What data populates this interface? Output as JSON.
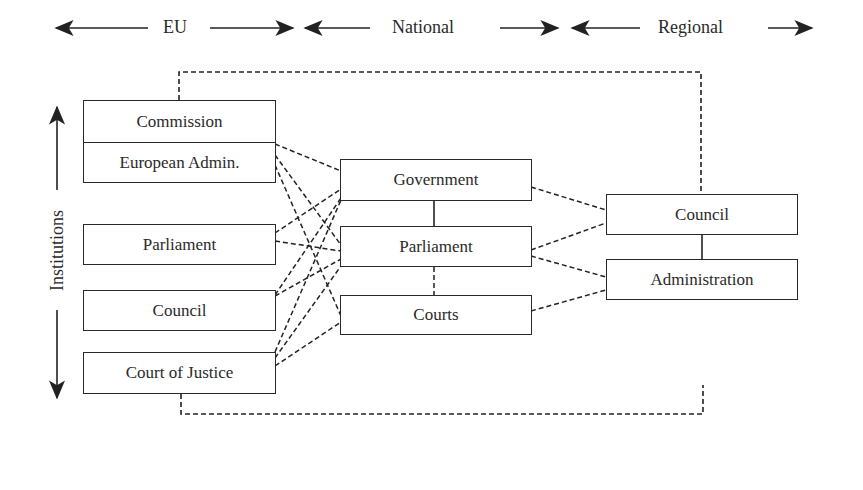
{
  "header": {
    "levels": [
      {
        "label": "EU"
      },
      {
        "label": "National"
      },
      {
        "label": "Regional"
      }
    ]
  },
  "axis": {
    "label": "Institutions"
  },
  "eu_boxes": [
    {
      "id": "commission",
      "label": "Commission"
    },
    {
      "id": "european_admin",
      "label": "European Admin."
    },
    {
      "id": "eu_parliament",
      "label": "Parliament"
    },
    {
      "id": "eu_council",
      "label": "Council"
    },
    {
      "id": "court_of_justice",
      "label": "Court of Justice"
    }
  ],
  "national_boxes": [
    {
      "id": "government",
      "label": "Government"
    },
    {
      "id": "nat_parliament",
      "label": "Parliament"
    },
    {
      "id": "courts",
      "label": "Courts"
    }
  ],
  "regional_boxes": [
    {
      "id": "reg_council",
      "label": "Council"
    },
    {
      "id": "administration",
      "label": "Administration"
    }
  ],
  "connections": {
    "solid": [
      [
        "government",
        "nat_parliament"
      ],
      [
        "reg_council",
        "administration"
      ]
    ],
    "dashed": [
      [
        "nat_parliament",
        "courts"
      ],
      [
        "european_admin",
        "government"
      ],
      [
        "european_admin",
        "nat_parliament"
      ],
      [
        "european_admin",
        "courts"
      ],
      [
        "eu_parliament",
        "government"
      ],
      [
        "eu_parliament",
        "nat_parliament"
      ],
      [
        "eu_council",
        "government"
      ],
      [
        "eu_council",
        "nat_parliament"
      ],
      [
        "court_of_justice",
        "government"
      ],
      [
        "court_of_justice",
        "nat_parliament"
      ],
      [
        "court_of_justice",
        "courts"
      ],
      [
        "government",
        "reg_council"
      ],
      [
        "nat_parliament",
        "reg_council"
      ],
      [
        "nat_parliament",
        "administration"
      ],
      [
        "courts",
        "administration"
      ],
      [
        "commission",
        "reg_council"
      ],
      [
        "court_of_justice",
        "administration"
      ]
    ]
  }
}
